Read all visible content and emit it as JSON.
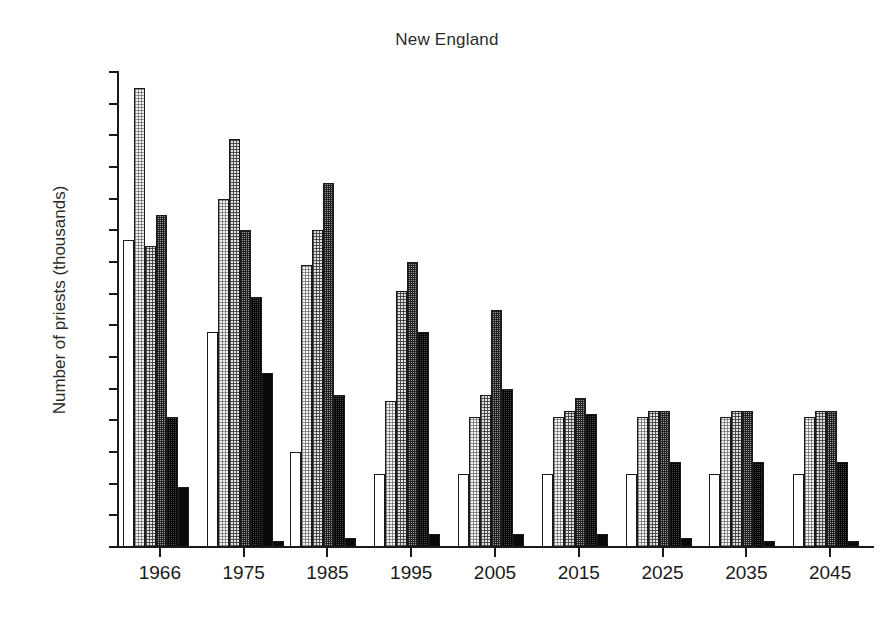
{
  "chart_data": {
    "type": "bar",
    "title": "New England",
    "xlabel": "",
    "ylabel": "Number of priests (thousands)",
    "ylim": [
      0.0,
      1.5
    ],
    "ytick_labels": [
      "0.0",
      "0.1",
      "0.2",
      "0.3",
      "0.4",
      "0.5",
      "0.6",
      "0.7",
      "0.8",
      "0.9",
      "1.0",
      "1.1",
      "1.2",
      "1.3",
      "1.4",
      "1.5"
    ],
    "ytick_values": [
      0.0,
      0.1,
      0.2,
      0.3,
      0.4,
      0.5,
      0.6,
      0.7,
      0.8,
      0.9,
      1.0,
      1.1,
      1.2,
      1.3,
      1.4,
      1.5
    ],
    "grid": false,
    "legend_position": "none",
    "categories": [
      "1966",
      "1975",
      "1985",
      "1995",
      "2005",
      "2015",
      "2025",
      "2035",
      "2045"
    ],
    "series": [
      {
        "name": "series-1",
        "fill": "white",
        "values": [
          0.97,
          0.68,
          0.3,
          0.23,
          0.23,
          0.23,
          0.23,
          0.23,
          0.23
        ]
      },
      {
        "name": "series-2",
        "fill": "light-stipple",
        "values": [
          1.45,
          1.1,
          0.89,
          0.46,
          0.41,
          0.41,
          0.41,
          0.41,
          0.41
        ]
      },
      {
        "name": "series-3",
        "fill": "medium-stipple",
        "values": [
          0.95,
          1.29,
          1.0,
          0.81,
          0.48,
          0.43,
          0.43,
          0.43,
          0.43
        ]
      },
      {
        "name": "series-4",
        "fill": "dark-stipple",
        "values": [
          1.05,
          1.0,
          1.15,
          0.9,
          0.75,
          0.47,
          0.43,
          0.43,
          0.43
        ]
      },
      {
        "name": "series-5",
        "fill": "darker-stipple",
        "values": [
          0.41,
          0.79,
          0.48,
          0.68,
          0.5,
          0.42,
          0.27,
          0.27,
          0.27
        ]
      },
      {
        "name": "series-6",
        "fill": "black",
        "values": [
          0.19,
          0.55,
          0.03,
          0.04,
          0.04,
          0.04,
          0.03,
          0.02,
          0.02
        ]
      }
    ],
    "extra_marks": [
      {
        "category": "1975",
        "value": 0.02,
        "fill": "black",
        "note": "small trailing bar"
      }
    ]
  }
}
